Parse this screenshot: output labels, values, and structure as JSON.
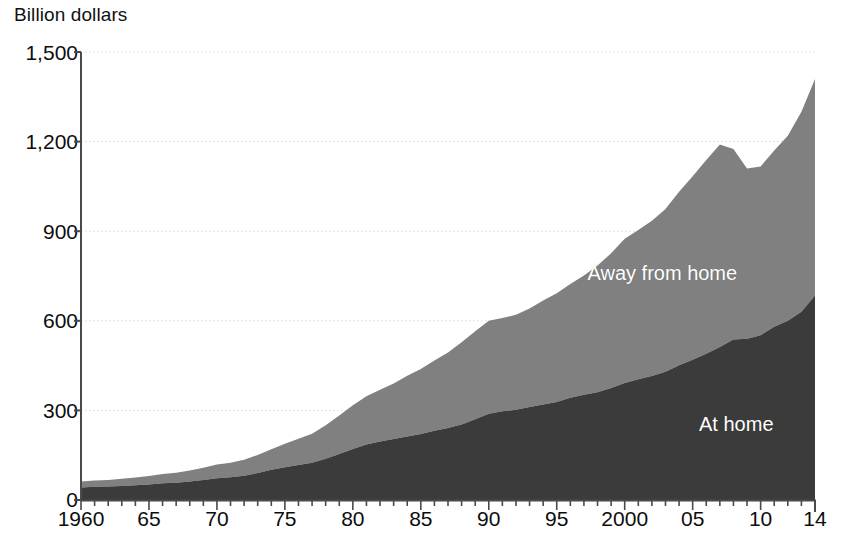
{
  "chart_data": {
    "type": "area",
    "stacked": true,
    "title": "",
    "subtitle": "",
    "ylabel": "Billion dollars",
    "xlabel": "",
    "ylim": [
      0,
      1500
    ],
    "xlim": [
      1960,
      2014
    ],
    "grid": true,
    "grid_style": "dotted-horizontal",
    "legend_position": "inline-annotation",
    "y_ticks": [
      0,
      300,
      600,
      900,
      1200,
      1500
    ],
    "y_tick_labels": [
      "0",
      "300",
      "600",
      "900",
      "1,200",
      "1,500"
    ],
    "x_ticks": [
      1960,
      1965,
      1970,
      1975,
      1980,
      1985,
      1990,
      1995,
      2000,
      2005,
      2010,
      2014
    ],
    "x_tick_labels": [
      "1960",
      "65",
      "70",
      "75",
      "80",
      "85",
      "90",
      "95",
      "2000",
      "05",
      "10",
      "14"
    ],
    "x_minor_tick_interval": 1,
    "x": [
      1960,
      1961,
      1962,
      1963,
      1964,
      1965,
      1966,
      1967,
      1968,
      1969,
      1970,
      1971,
      1972,
      1973,
      1974,
      1975,
      1976,
      1977,
      1978,
      1979,
      1980,
      1981,
      1982,
      1983,
      1984,
      1985,
      1986,
      1987,
      1988,
      1989,
      1990,
      1991,
      1992,
      1993,
      1994,
      1995,
      1996,
      1997,
      1998,
      1999,
      2000,
      2001,
      2002,
      2003,
      2004,
      2005,
      2006,
      2007,
      2008,
      2009,
      2010,
      2011,
      2012,
      2013,
      2014
    ],
    "series": [
      {
        "name": "At home",
        "color": "#3b3b3b",
        "label_color": "#ffffff",
        "values": [
          42,
          44,
          45,
          47,
          49,
          52,
          56,
          58,
          62,
          67,
          73,
          76,
          81,
          90,
          101,
          110,
          117,
          125,
          138,
          154,
          171,
          186,
          196,
          204,
          213,
          221,
          232,
          241,
          253,
          270,
          289,
          297,
          302,
          311,
          320,
          328,
          342,
          352,
          361,
          375,
          392,
          404,
          415,
          429,
          451,
          470,
          490,
          512,
          537,
          540,
          552,
          580,
          600,
          630,
          685
        ]
      },
      {
        "name": "Away from home",
        "color": "#808080",
        "label_color": "#ffffff",
        "values": [
          20,
          21,
          22,
          24,
          26,
          28,
          31,
          33,
          37,
          41,
          46,
          49,
          54,
          61,
          69,
          78,
          88,
          97,
          112,
          129,
          146,
          161,
          173,
          186,
          203,
          218,
          235,
          253,
          275,
          295,
          311,
          312,
          318,
          330,
          348,
          364,
          381,
          400,
          424,
          451,
          483,
          500,
          520,
          545,
          581,
          614,
          648,
          678,
          638,
          570,
          565,
          590,
          620,
          670,
          725
        ]
      }
    ],
    "annotations": [
      {
        "text": "Away from home",
        "x": 2003,
        "y": 760,
        "color": "#ffffff"
      },
      {
        "text": "At home",
        "x": 2009,
        "y": 255,
        "color": "#ffffff"
      }
    ],
    "totals_note": "Stacked totals reach about 1,410 in 2014 and peak near 1,175 in 2008 before a dip.",
    "colors": {
      "at_home": "#3b3b3b",
      "away_from_home": "#808080",
      "axis": "#4a4a4a",
      "grid": "#d6d6d6",
      "background": "#ffffff",
      "text": "#0d0d0d"
    }
  },
  "axis": {
    "y_title": "Billion dollars"
  }
}
